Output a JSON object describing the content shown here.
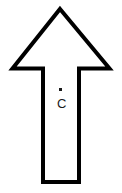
{
  "figure": {
    "type": "arrow-diagram",
    "width": 122,
    "height": 193,
    "background_color": "#ffffff"
  },
  "arrow": {
    "name": "up-arrow",
    "direction": "up",
    "fill_color": "#ffffff",
    "stroke_color": "#000000",
    "stroke_width": 4,
    "outline_path": "M 60 9 L 109.5 68.5 L 79 68.5 L 79 182 L 43 182 L 43 68.5 L 12.5 68.5 Z",
    "apex": [
      60,
      9
    ],
    "barb_left": [
      12.5,
      68.5
    ],
    "barb_right": [
      109.5,
      68.5
    ],
    "shoulder_left": [
      43,
      68.5
    ],
    "shoulder_right": [
      79,
      68.5
    ],
    "shaft_left": 43,
    "shaft_right": 79,
    "shaft_bottom": 182
  },
  "annotations": {
    "point_c": {
      "marker_label": "point-dot",
      "label": "C",
      "marker_x": 60,
      "marker_y": 89,
      "label_x": 61,
      "label_y": 101,
      "color": "#1a1a1a"
    }
  }
}
